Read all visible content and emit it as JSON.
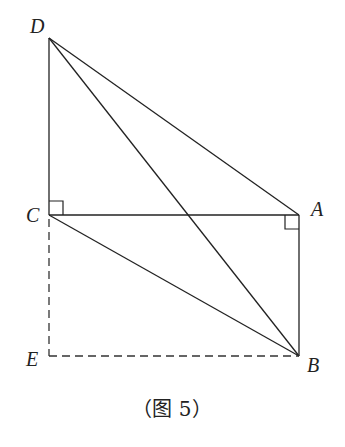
{
  "figure": {
    "caption": "（图 5）",
    "points": {
      "D": {
        "label": "D",
        "x": 49,
        "y": 38
      },
      "C": {
        "label": "C",
        "x": 49,
        "y": 215
      },
      "A": {
        "label": "A",
        "x": 299,
        "y": 215
      },
      "B": {
        "label": "B",
        "x": 299,
        "y": 356
      },
      "E": {
        "label": "E",
        "x": 49,
        "y": 356
      }
    },
    "solid_segments": [
      "DC",
      "DA",
      "DB",
      "CA",
      "CB",
      "AB"
    ],
    "dashed_segments": [
      "CE",
      "EB"
    ],
    "right_angles": [
      "C (DC ⟂ CA)",
      "A (CA ⟂ AB)"
    ]
  }
}
